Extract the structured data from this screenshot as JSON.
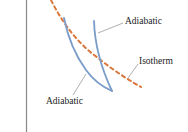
{
  "diagram": {
    "type": "pv-diagram-fragment",
    "colors": {
      "axis": "#888888",
      "adiabatic": "#7a9cc9",
      "isotherm": "#d9763a",
      "leader": "#999999",
      "text": "#222222"
    },
    "labels": {
      "adiabatic_top": "Adiabatic",
      "isotherm": "Isotherm",
      "adiabatic_bottom": "Adiabatic"
    },
    "curves": [
      {
        "name": "isotherm",
        "style": "dashed"
      },
      {
        "name": "adiabatic-left",
        "style": "solid"
      },
      {
        "name": "adiabatic-right",
        "style": "solid"
      }
    ]
  }
}
